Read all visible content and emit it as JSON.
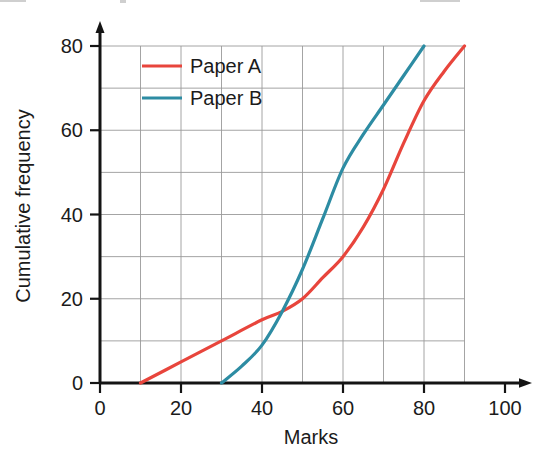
{
  "chart_data": {
    "type": "line",
    "title": "",
    "xlabel": "Marks",
    "ylabel": "Cumulative frequency",
    "xlim": [
      0,
      100
    ],
    "ylim": [
      0,
      80
    ],
    "xticks": [
      0,
      20,
      40,
      60,
      80,
      100
    ],
    "yticks": [
      0,
      20,
      40,
      60,
      80
    ],
    "xtick_labels": [
      "0",
      "20",
      "40",
      "60",
      "80",
      "100"
    ],
    "ytick_labels": [
      "0",
      "20",
      "40",
      "60",
      "80"
    ],
    "grid": true,
    "grid_step_x": 10,
    "grid_step_y": 10,
    "legend_position": "top-left-inside",
    "series": [
      {
        "name": "Paper A",
        "color": "#e8453c",
        "x": [
          10,
          20,
          30,
          40,
          45,
          50,
          55,
          60,
          65,
          70,
          75,
          80,
          85,
          90
        ],
        "values": [
          0,
          5,
          10,
          15,
          17,
          20,
          25,
          30,
          37,
          46,
          57,
          67,
          74,
          80
        ]
      },
      {
        "name": "Paper B",
        "color": "#2d8ca3",
        "x": [
          30,
          35,
          40,
          45,
          50,
          55,
          60,
          65,
          70,
          75,
          80
        ],
        "values": [
          0,
          4,
          9,
          17,
          27,
          39,
          51,
          59,
          66,
          73,
          80
        ]
      }
    ]
  },
  "legend": {
    "entries": [
      {
        "label": "Paper A",
        "color": "#e8453c"
      },
      {
        "label": "Paper B",
        "color": "#2d8ca3"
      }
    ]
  },
  "axes": {
    "x_title": "Marks",
    "y_title": "Cumulative frequency"
  }
}
